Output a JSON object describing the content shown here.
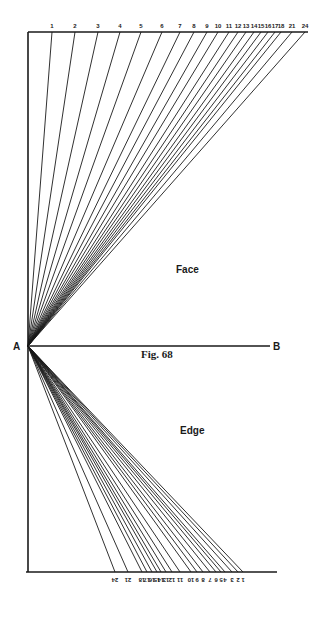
{
  "figure": {
    "caption": "Fig. 68",
    "point_a": "A",
    "point_b": "B",
    "face_label": "Face",
    "edge_label": "Edge"
  },
  "diagram": {
    "apex": [
      28,
      346
    ],
    "left_vertical": {
      "x": 28,
      "top": 32,
      "bottom": 572
    },
    "top_line": {
      "y": 32,
      "x1": 28,
      "x2": 308
    },
    "bottom_line": {
      "y": 572,
      "x1": 26,
      "x2": 277
    },
    "ab_line": {
      "y": 346,
      "x1": 28,
      "x2": 270
    },
    "face_rays": [
      {
        "label": "1",
        "x": 52
      },
      {
        "label": "2",
        "x": 75
      },
      {
        "label": "3",
        "x": 98
      },
      {
        "label": "4",
        "x": 120
      },
      {
        "label": "5",
        "x": 141
      },
      {
        "label": "6",
        "x": 162
      },
      {
        "label": "7",
        "x": 180
      },
      {
        "label": "8",
        "x": 194
      },
      {
        "label": "9",
        "x": 207
      },
      {
        "label": "10",
        "x": 218
      },
      {
        "label": "11",
        "x": 229
      },
      {
        "label": "12",
        "x": 238
      },
      {
        "label": "13",
        "x": 246
      },
      {
        "label": "14",
        "x": 254
      },
      {
        "label": "15",
        "x": 261
      },
      {
        "label": "16",
        "x": 268
      },
      {
        "label": "17",
        "x": 275
      },
      {
        "label": "18",
        "x": 281
      },
      {
        "label": "21",
        "x": 292
      },
      {
        "label": "24",
        "x": 305
      }
    ],
    "edge_rays": [
      {
        "label": "24",
        "x": 115
      },
      {
        "label": "21",
        "x": 128
      },
      {
        "label": "18",
        "x": 142
      },
      {
        "label": "17",
        "x": 147
      },
      {
        "label": "16",
        "x": 152
      },
      {
        "label": "15",
        "x": 157
      },
      {
        "label": "14",
        "x": 161
      },
      {
        "label": "13",
        "x": 166
      },
      {
        "label": "12",
        "x": 172
      },
      {
        "label": "11",
        "x": 180
      },
      {
        "label": "10",
        "x": 191
      },
      {
        "label": "9",
        "x": 197
      },
      {
        "label": "8",
        "x": 203
      },
      {
        "label": "7",
        "x": 210
      },
      {
        "label": "6",
        "x": 216
      },
      {
        "label": "5",
        "x": 221
      },
      {
        "label": "4",
        "x": 225
      },
      {
        "label": "3",
        "x": 232
      },
      {
        "label": "2",
        "x": 238
      },
      {
        "label": "1",
        "x": 243
      }
    ]
  }
}
